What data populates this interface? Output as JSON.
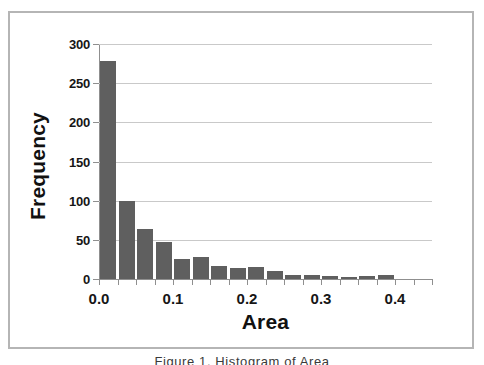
{
  "chart_data": {
    "type": "bar",
    "title": "",
    "xlabel": "Area",
    "ylabel": "Frequency",
    "xlim": [
      0.0,
      0.45
    ],
    "ylim": [
      0,
      300
    ],
    "grid": true,
    "legend": null,
    "bin_width": 0.025,
    "bar_color": "#5f5f5f",
    "categories": [
      "0.000",
      "0.025",
      "0.050",
      "0.075",
      "0.100",
      "0.125",
      "0.150",
      "0.175",
      "0.200",
      "0.225",
      "0.250",
      "0.275",
      "0.300",
      "0.325",
      "0.350",
      "0.375",
      "0.400",
      "0.425"
    ],
    "bin_centers": [
      0.0125,
      0.0375,
      0.0625,
      0.0875,
      0.1125,
      0.1375,
      0.1625,
      0.1875,
      0.2125,
      0.2375,
      0.2625,
      0.2875,
      0.3125,
      0.3375,
      0.3625,
      0.3875,
      0.4125,
      0.4375
    ],
    "values": [
      278,
      100,
      64,
      47,
      26,
      28,
      17,
      14,
      15,
      10,
      5,
      5,
      4,
      2,
      4,
      5,
      0,
      0
    ],
    "y_ticks": [
      0,
      50,
      100,
      150,
      200,
      250,
      300
    ],
    "y_tick_labels": [
      "0",
      "50",
      "100",
      "150",
      "200",
      "250",
      "300"
    ],
    "x_ticks": [
      0.0,
      0.1,
      0.2,
      0.3,
      0.4
    ],
    "x_tick_labels": [
      "0.0",
      "0.1",
      "0.2",
      "0.3",
      "0.4"
    ]
  },
  "caption": {
    "partial_text": "Figure 1. Histogram of Area"
  }
}
